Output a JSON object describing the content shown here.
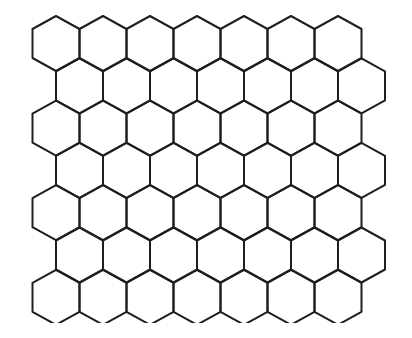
{
  "diagram": {
    "type": "hexagonal-grid",
    "orientation": "pointy-top",
    "rows": 7,
    "hexes_per_row": 7,
    "row_offset_pattern": "odd rows shifted right by half a hex",
    "origin_first_top_vertex": [
      56,
      16
    ],
    "hex_width": 47,
    "row_pitch": 42.3,
    "corner_drop": 13,
    "side_length": 29,
    "clip_bottom_y": 323,
    "stroke_color": "#1e1e1e",
    "stroke_width": 2,
    "background": "#ffffff"
  }
}
